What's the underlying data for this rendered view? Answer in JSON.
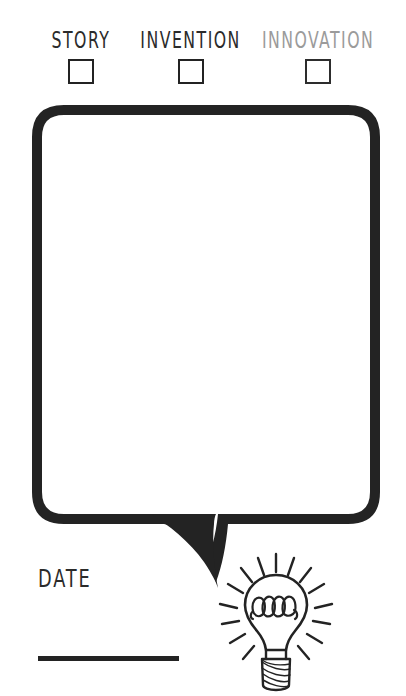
{
  "page": {
    "type": "worksheet",
    "background_color": "#ffffff",
    "ink_color": "#232323",
    "muted_ink_color": "#9b9b9b"
  },
  "categories": [
    {
      "label": "STORY",
      "checked": false,
      "color": "#2b2b2b",
      "checkbox_name": "story-checkbox"
    },
    {
      "label": "INVENTION",
      "checked": false,
      "color": "#2b2b2b",
      "checkbox_name": "invention-checkbox"
    },
    {
      "label": "INNOVATION",
      "checked": false,
      "color": "#9b9b9b",
      "checkbox_name": "innovation-checkbox"
    }
  ],
  "bubble": {
    "name": "speech-bubble",
    "content": "",
    "placeholder": "",
    "stroke_color": "#232323",
    "fill_color": "#ffffff",
    "tail_direction": "bottom-right"
  },
  "date": {
    "label": "DATE",
    "value": "",
    "placeholder": ""
  },
  "icons": {
    "lightbulb": "lightbulb-icon",
    "checkbox": "checkbox-icon"
  }
}
